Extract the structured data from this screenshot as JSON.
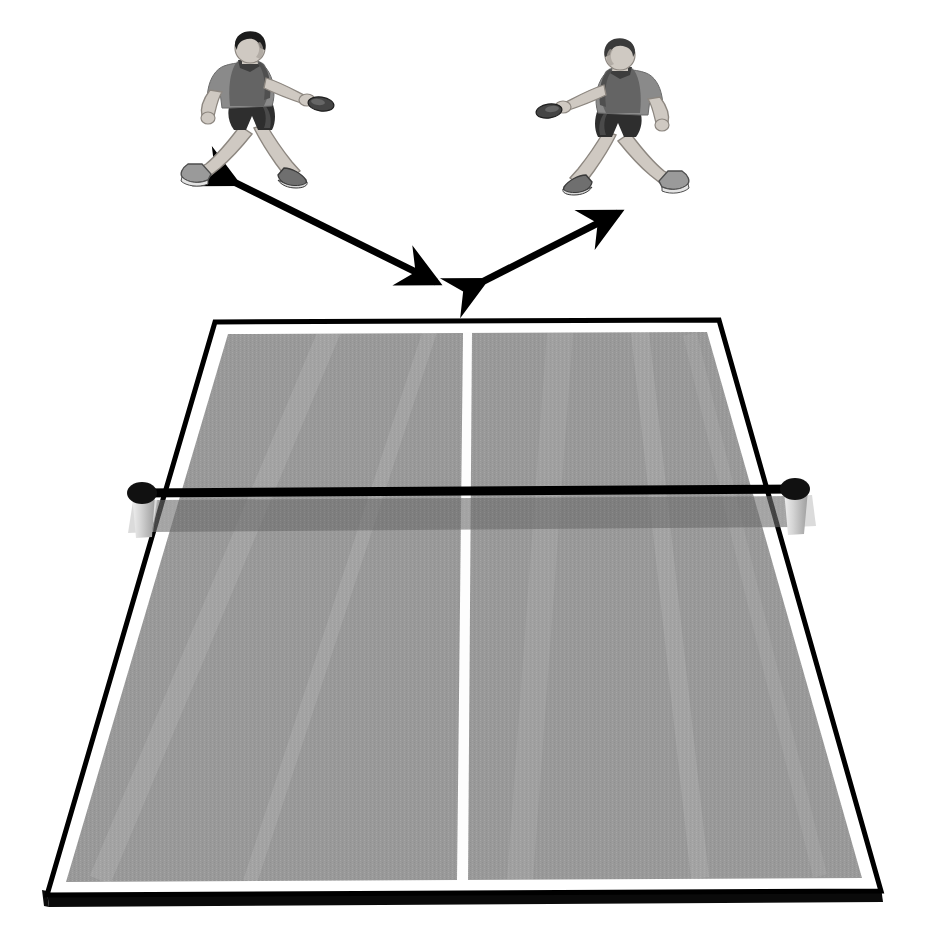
{
  "scene": {
    "title": "Table tennis ready-position footwork diagram",
    "background_color": "#ffffff",
    "width": 943,
    "height": 943,
    "caption": ""
  },
  "colors": {
    "background": "#ffffff",
    "table_surface": "#999999",
    "table_surface_dark": "#8e8e8e",
    "table_line_white": "#fdfdfd",
    "table_border_white": "#ffffff",
    "table_outline_black": "#000000",
    "table_edge_black": "#0a0a0a",
    "net_band": "#6e6e6e",
    "net_cord": "#000000",
    "net_post": "#c9c9c9",
    "net_post_knob": "#111111",
    "arrow": "#000000",
    "skin": "#cfc9c2",
    "skin_shadow": "#a8a29b",
    "shirt_light": "#8a8a8a",
    "shirt_dark": "#4a4a4a",
    "shorts": "#2e2e2e",
    "hair": "#1c1c1c",
    "shoe_light": "#b9b9b9",
    "shoe_dark": "#5d5d5d",
    "paddle": "#3a3a3a"
  },
  "table": {
    "name": "table-tennis-table",
    "perspective": "one-point, viewed from near end",
    "halves": 2,
    "corners": {
      "top_left": [
        215,
        322
      ],
      "top_right": [
        719,
        320
      ],
      "bottom_right": [
        881,
        891
      ],
      "bottom_left": [
        47,
        895
      ]
    },
    "edge_thickness_px": 14,
    "surface_label": "playing surface",
    "center_line_label": "center line",
    "border_line_label": "white side line",
    "notes": ""
  },
  "net": {
    "name": "net",
    "cord_y_left": 493,
    "cord_y_right": 489,
    "band_height_px": 31,
    "posts": [
      {
        "id": "left-post",
        "knob_x": 142,
        "knob_y": 493,
        "label": "net post left"
      },
      {
        "id": "right-post",
        "knob_x": 795,
        "knob_y": 489,
        "label": "net post right"
      }
    ]
  },
  "players": [
    {
      "id": "player-left",
      "label": "Player on the left",
      "facing": "right",
      "x": 180,
      "y": 38,
      "width": 145,
      "height": 155,
      "stance": "wide ready stance",
      "paddle_hand": "right"
    },
    {
      "id": "player-right",
      "label": "Player on the right",
      "facing": "left",
      "x": 545,
      "y": 45,
      "width": 145,
      "height": 155,
      "stance": "wide ready stance",
      "paddle_hand": "left"
    }
  ],
  "arrows": [
    {
      "id": "arrow-left",
      "label": "Left movement arrow",
      "double_headed": true,
      "from": [
        232,
        181
      ],
      "to": [
        440,
        284
      ],
      "thickness_px": 7
    },
    {
      "id": "arrow-right",
      "label": "Right movement arrow",
      "double_headed": true,
      "from": [
        480,
        283
      ],
      "to": [
        622,
        211
      ],
      "thickness_px": 7
    }
  ]
}
